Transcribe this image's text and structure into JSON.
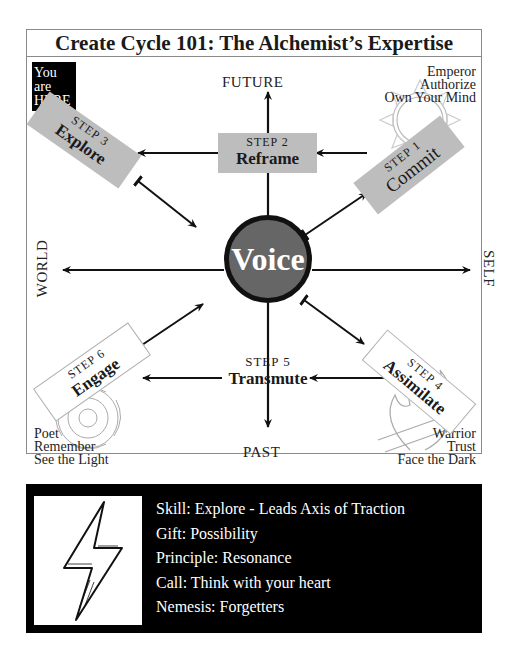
{
  "title": "Create Cycle 101:  The Alchemist’s Expertise",
  "you_are_here": [
    "You are",
    "HERE"
  ],
  "axes": {
    "top": "FUTURE",
    "bottom": "PAST",
    "left": "WORLD",
    "right": "SELF"
  },
  "center": {
    "label": "Voice"
  },
  "steps": [
    {
      "num": "STEP 1",
      "name": "Commit"
    },
    {
      "num": "STEP 2",
      "name": "Reframe"
    },
    {
      "num": "STEP 3",
      "name": "Explore"
    },
    {
      "num": "STEP 4",
      "name": "Assimilate"
    },
    {
      "num": "STEP 5",
      "name": "Transmute"
    },
    {
      "num": "STEP 6",
      "name": "Engage"
    }
  ],
  "archetypes": {
    "top_right": [
      "Emperor",
      "Authorize",
      "Own Your Mind"
    ],
    "bottom_left": [
      "Poet",
      "Remember",
      "See the Light"
    ],
    "bottom_right": [
      "Warrior",
      "Trust",
      "Face the Dark"
    ]
  },
  "info": {
    "icon": "lightning-bolt-icon",
    "lines": [
      "Skill: Explore - Leads Axis of Traction",
      "Gift: Possibility",
      "Principle: Resonance",
      "Call: Think with your heart",
      "Nemesis: Forgetters"
    ]
  },
  "colors": {
    "highlight_step_fill": "#bdbdbd",
    "voice_fill": "#666666",
    "panel_bg": "#000000"
  }
}
